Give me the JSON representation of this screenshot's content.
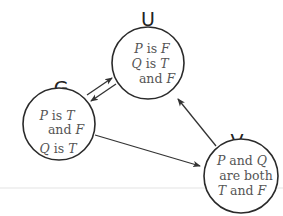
{
  "diagram": {
    "type": "state-diagram",
    "nodes": [
      {
        "id": "U",
        "label": "U",
        "lines": [
          {
            "a": "P",
            "b": " is ",
            "c": "F"
          },
          {
            "a": "Q",
            "b": " is ",
            "c": "T"
          },
          {
            "a": "",
            "b": "and ",
            "c": "F"
          }
        ]
      },
      {
        "id": "G",
        "label": "G",
        "lines": [
          {
            "a": "P",
            "b": " is ",
            "c": "T"
          },
          {
            "a": "",
            "b": "and ",
            "c": "F"
          },
          {
            "a": "Q",
            "b": " is ",
            "c": "T"
          }
        ]
      },
      {
        "id": "V",
        "label": "V",
        "lines": [
          {
            "a": "P",
            "b": " and ",
            "c": "Q"
          },
          {
            "a": "",
            "b": "are both",
            "c": ""
          },
          {
            "a": "T",
            "b": " and ",
            "c": "F"
          }
        ]
      }
    ],
    "edges": [
      {
        "from": "G",
        "to": "U"
      },
      {
        "from": "U",
        "to": "G"
      },
      {
        "from": "G",
        "to": "V"
      },
      {
        "from": "V",
        "to": "U"
      }
    ],
    "colors": {
      "stroke": "#2a2a2a",
      "text": "#555555",
      "label": "#222222",
      "rule": "#e4e4e4"
    }
  }
}
